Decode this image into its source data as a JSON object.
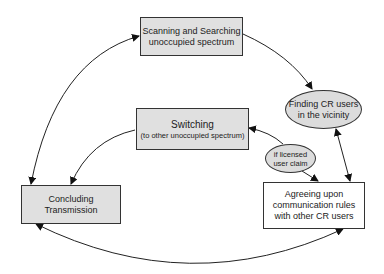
{
  "diagram": {
    "nodes": {
      "scanning": {
        "line1": "Scanning and Searching",
        "line2": "unoccupied spectrum",
        "shape": "rectangle",
        "fill": "#e0e0e0"
      },
      "switching": {
        "line1": "Switching",
        "line2": "(to other unoccupied spectrum)",
        "shape": "rectangle",
        "fill": "#e0e0e0"
      },
      "finding": {
        "line1": "Finding CR users",
        "line2": "in the vicinity",
        "shape": "ellipse",
        "fill": "#dcdcdc"
      },
      "licensed": {
        "line1": "if licensed",
        "line2": "user claim",
        "shape": "ellipse",
        "fill": "#dcdcdc"
      },
      "agreeing": {
        "line1": "Agreeing upon",
        "line2": "communication rules",
        "line3": "with other CR users",
        "shape": "rectangle",
        "fill": "#ffffff"
      },
      "concluding": {
        "line1": "Concluding",
        "line2": "Transmission",
        "shape": "rectangle",
        "fill": "#e0e0e0"
      }
    },
    "edges": [
      {
        "from": "concluding",
        "to": "scanning",
        "direction": "both"
      },
      {
        "from": "scanning",
        "to": "finding",
        "direction": "forward"
      },
      {
        "from": "finding",
        "to": "agreeing",
        "direction": "both"
      },
      {
        "from": "licensed",
        "to": "switching",
        "direction": "forward"
      },
      {
        "from": "licensed",
        "to": "agreeing",
        "direction": "forward"
      },
      {
        "from": "switching",
        "to": "concluding",
        "direction": "forward"
      },
      {
        "from": "agreeing",
        "to": "concluding",
        "direction": "both"
      }
    ]
  }
}
